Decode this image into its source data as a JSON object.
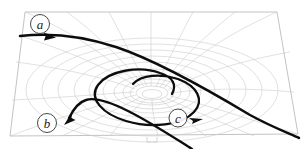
{
  "figure": {
    "background_color": "#ffffff",
    "width": 305,
    "height": 149
  },
  "colors": {
    "grid": "#c8c8c8",
    "grid_inner": "#bdbdbd",
    "sheet_edge": "#b4b4b4",
    "trajectory": "#0d0d0d",
    "label_stroke": "#333333",
    "label_fill": "#ffffff",
    "label_text": "#1a1a1a"
  },
  "sheet": {
    "name": "curved-spacetime-sheet",
    "shape": "parallelogram",
    "corners": [
      {
        "x": 25,
        "y": 12
      },
      {
        "x": 277,
        "y": 12
      },
      {
        "x": 298,
        "y": 134
      },
      {
        "x": 10,
        "y": 136
      }
    ]
  },
  "well": {
    "name": "gravity-well-funnel",
    "center_x": 152,
    "center_y": 92,
    "throat_radius_x": 16,
    "throat_radius_y": 6,
    "outer_radius_x": 128,
    "outer_radius_y": 54,
    "ring_count": 11,
    "radial_count": 20
  },
  "labels": [
    {
      "id": "a",
      "text": "a",
      "name": "label-a",
      "circle": {
        "cx": 40,
        "cy": 24,
        "r": 9.5
      },
      "meaning": "hyperbolic flyby trajectory"
    },
    {
      "id": "b",
      "text": "b",
      "name": "label-b",
      "circle": {
        "cx": 47,
        "cy": 123,
        "r": 9.5
      },
      "meaning": "escape / ejection trajectory"
    },
    {
      "id": "c",
      "text": "c",
      "name": "label-c",
      "circle": {
        "cx": 178,
        "cy": 118,
        "r": 9.0
      },
      "meaning": "capture inspiral trajectory"
    }
  ],
  "trajectories": [
    {
      "id": "a",
      "name": "trajectory-a-hyperbolic-flyby",
      "description": "Enters from the left, bends around the well and exits at the lower right corner.",
      "stroke_width": 2.5,
      "path": "M 22,36 C 48,34 82,36 118,48 C 160,62 212,92 252,116 C 272,127 288,133 298,137",
      "arrow": {
        "x": 49,
        "y": 35,
        "angle": 4
      }
    },
    {
      "id": "b",
      "name": "trajectory-b-escape",
      "description": "Leaves the funnel rim and shoots out toward the lower left, arrow pointing up-left.",
      "stroke_width": 2.4,
      "path": "M 190,148 C 174,138 150,122 126,110 C 108,101 94,97 85,100 C 78,102 72,110 68,118",
      "arrow": {
        "x": 66,
        "y": 121,
        "angle": 208
      }
    },
    {
      "id": "c",
      "name": "trajectory-c-inspiral",
      "description": "Spiral that winds inward around the funnel throat, arrow pointing right at the bottom.",
      "stroke_width": 2.3,
      "path": "M 171,93 C 175,85 172,78 160,74 C 140,67 110,72 100,85 C 90,98 103,113 125,120 C 150,128 180,124 192,112 C 203,101 196,87 178,80 C 162,74 142,76 134,85",
      "arrow": {
        "x": 196,
        "y": 119,
        "angle": 18
      }
    }
  ],
  "annotations": {
    "base_mark": {
      "name": "base-tick-mark",
      "x": 152,
      "y": 139,
      "width": 10,
      "height": 5
    }
  }
}
